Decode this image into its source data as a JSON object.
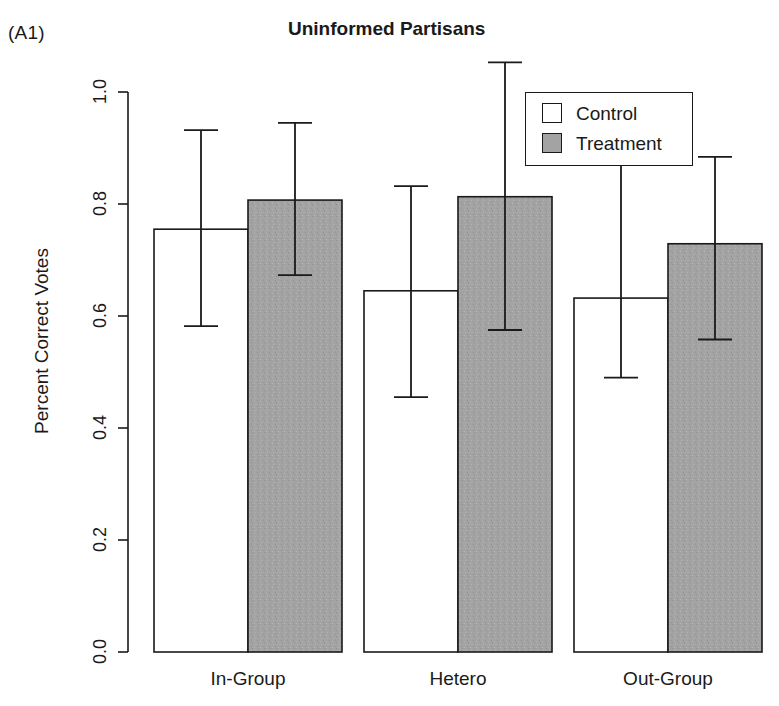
{
  "panel": {
    "tag": "(A1)"
  },
  "chart_data": {
    "type": "bar",
    "title": "Uninformed Partisans",
    "xlabel": "",
    "ylabel": "Percent Correct Votes",
    "ylim": [
      0.0,
      1.0
    ],
    "yticks": [
      "0.0",
      "0.2",
      "0.4",
      "0.6",
      "0.8",
      "1.0"
    ],
    "ytick_values": [
      0.0,
      0.2,
      0.4,
      0.6,
      0.8,
      1.0
    ],
    "grid": false,
    "legend_position": "top-right",
    "categories": [
      "In-Group",
      "Hetero",
      "Out-Group"
    ],
    "series": [
      {
        "name": "Control",
        "color": "#ffffff",
        "values": [
          0.755,
          0.645,
          0.632
        ],
        "ci_low": [
          0.582,
          0.455,
          0.49
        ],
        "ci_high": [
          0.932,
          0.832,
          0.912
        ]
      },
      {
        "name": "Treatment",
        "color": "#a3a3a3",
        "values": [
          0.807,
          0.813,
          0.729
        ],
        "ci_low": [
          0.673,
          0.575,
          0.558
        ],
        "ci_high": [
          0.945,
          1.053,
          0.884
        ]
      }
    ]
  },
  "legend": {
    "items": [
      {
        "label": "Control",
        "swatch": "#ffffff"
      },
      {
        "label": "Treatment",
        "swatch": "#a3a3a3"
      }
    ]
  },
  "colors": {
    "axis": "#1a1a1a",
    "control_fill": "#ffffff",
    "treatment_fill": "#a3a3a3",
    "text": "#1a1a1a"
  }
}
